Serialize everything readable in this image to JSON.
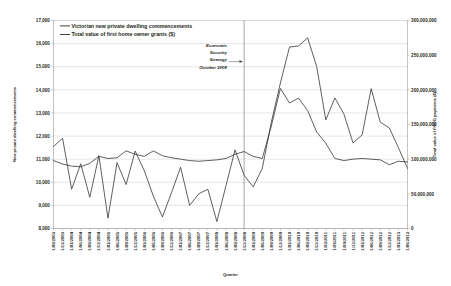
{
  "chart_data": {
    "type": "line",
    "title": "",
    "xlabel": "Quarter",
    "ylabel": "New private dwelling commencements",
    "ylabel_right": "Total value of FHOG payments ($)",
    "ylim": [
      8000,
      17000
    ],
    "yticks": [
      "8,000",
      "9,000",
      "10,000",
      "11,000",
      "12,000",
      "13,000",
      "14,000",
      "15,000",
      "16,000",
      "17,000"
    ],
    "ylim_right": [
      0,
      300000000
    ],
    "yticks_right": [
      "0",
      "50,000,000",
      "100,000,000",
      "150,000,000",
      "200,000,000",
      "250,000,000",
      "300,000,000"
    ],
    "grid": true,
    "legend_position": "top-left",
    "categories": [
      "1/09/2003",
      "1/12/2003",
      "1/03/2004",
      "1/06/2004",
      "1/09/2004",
      "1/12/2004",
      "1/03/2005",
      "1/06/2005",
      "1/09/2005",
      "1/12/2005",
      "1/03/2006",
      "1/06/2006",
      "1/09/2006",
      "1/12/2006",
      "1/03/2007",
      "1/06/2007",
      "1/09/2007",
      "1/12/2007",
      "1/03/2008",
      "1/06/2008",
      "1/09/2008",
      "1/12/2008",
      "1/03/2009",
      "1/06/2009",
      "1/09/2009",
      "1/12/2009",
      "1/03/2010",
      "1/06/2010",
      "1/09/2010",
      "1/12/2010",
      "1/03/2011",
      "1/06/2011",
      "1/09/2011",
      "1/12/2011",
      "1/03/2012",
      "1/06/2012",
      "1/09/2012",
      "1/12/2012",
      "1/03/2013",
      "1/06/2013"
    ],
    "series": [
      {
        "name": "Victorian new private dwelling commencements",
        "axis": "left",
        "values": [
          11550,
          11900,
          9700,
          10800,
          9350,
          11150,
          8450,
          10850,
          9900,
          11350,
          10500,
          9400,
          8500,
          9550,
          10650,
          9000,
          9500,
          9700,
          8300,
          9850,
          11400,
          10300,
          9800,
          10600,
          12600,
          14300,
          15850,
          15900,
          16250,
          15000,
          12700,
          13650,
          12950,
          11700,
          12050,
          14050,
          12600,
          12350,
          11500,
          10600
        ]
      },
      {
        "name": "Total value of first home owner grants ($)",
        "axis": "right",
        "values": [
          98000000,
          93000000,
          90000000,
          89000000,
          94000000,
          104000000,
          101000000,
          102000000,
          112000000,
          107000000,
          104000000,
          112000000,
          105000000,
          102000000,
          100000000,
          98000000,
          97000000,
          98000000,
          99000000,
          101000000,
          107000000,
          111000000,
          104000000,
          101000000,
          148000000,
          202000000,
          181000000,
          188000000,
          170000000,
          139000000,
          123000000,
          101000000,
          98000000,
          100000000,
          101000000,
          100000000,
          99000000,
          92000000,
          97000000,
          96000000
        ]
      }
    ],
    "annotations": [
      {
        "name": "economic-security-strategy",
        "lines": [
          "Economic",
          "Security",
          "Strategy",
          "October 2008"
        ],
        "marker_category": "1/12/2008"
      }
    ]
  }
}
